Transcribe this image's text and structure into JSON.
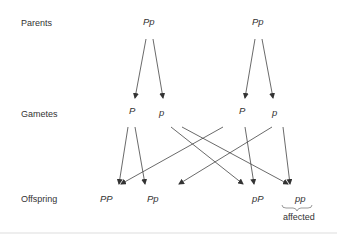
{
  "rows": {
    "parents": "Parents",
    "gametes": "Gametes",
    "offspring": "Offspring"
  },
  "parents": [
    "Pp",
    "Pp"
  ],
  "gametes": [
    "P",
    "p",
    "P",
    "p"
  ],
  "offspring": [
    "PP",
    "Pp",
    "pP",
    "pp"
  ],
  "annotation": "affected",
  "colors": {
    "line": "#333333",
    "text": "#333333"
  }
}
